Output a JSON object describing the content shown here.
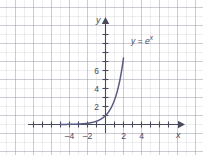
{
  "figure": {
    "width": 203,
    "height": 155,
    "background_color": "#ffffff",
    "grid_color": "#c4c4cf",
    "axis_color": "#4a4a5e",
    "curve_color": "#5a5a82"
  },
  "axes": {
    "x_axis_name": "x",
    "y_axis_name": "y",
    "x_ticks": [
      "–4",
      "–2",
      "2",
      "4"
    ],
    "y_ticks": [
      "2",
      "4",
      "6"
    ]
  },
  "annotations": {
    "curve_label_base": "y = e",
    "curve_label_exponent": "x"
  },
  "chart_data": {
    "type": "line",
    "title": "",
    "xlabel": "x",
    "ylabel": "y",
    "xlim": [
      -5.8,
      7.2
    ],
    "ylim": [
      -1.3,
      7.6
    ],
    "xticks": [
      -4,
      -2,
      2,
      4
    ],
    "yticks": [
      2,
      4,
      6
    ],
    "xticklabels": [
      "–4",
      "–2",
      "2",
      "4"
    ],
    "yticklabels": [
      "2",
      "4",
      "6"
    ],
    "grid": true,
    "legend": false,
    "annotations": [
      {
        "text": "y = e^x",
        "x": 3.0,
        "y": 6.6
      }
    ],
    "series": [
      {
        "name": "y = e^x",
        "color": "#5a5a82",
        "x": [
          -5.0,
          -4.5,
          -4.0,
          -3.5,
          -3.0,
          -2.5,
          -2.0,
          -1.5,
          -1.0,
          -0.5,
          0.0,
          0.25,
          0.5,
          0.75,
          1.0,
          1.25,
          1.5,
          1.75,
          2.0
        ],
        "y": [
          0.007,
          0.011,
          0.018,
          0.03,
          0.05,
          0.082,
          0.135,
          0.223,
          0.368,
          0.607,
          1.0,
          1.284,
          1.649,
          2.117,
          2.718,
          3.49,
          4.482,
          5.755,
          7.389
        ]
      }
    ]
  }
}
